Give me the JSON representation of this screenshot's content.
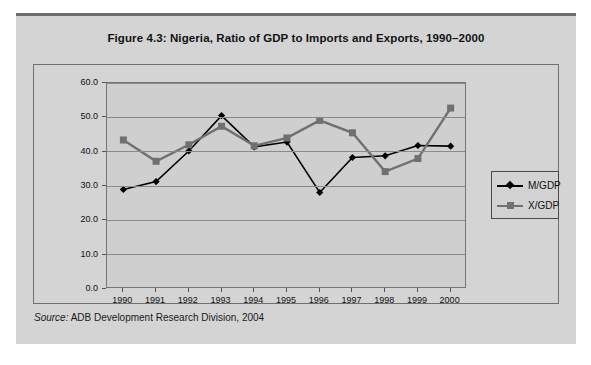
{
  "figure": {
    "title": "Figure 4.3:  Nigeria, Ratio of GDP to Imports and Exports, 1990–2000",
    "source_label": "Source:",
    "source_text": "ADB Development Research Division, 2004"
  },
  "legend": {
    "position": "inside-right",
    "items": [
      {
        "label": "M/GDP",
        "color": "#000000",
        "marker": "diamond"
      },
      {
        "label": "X/GDP",
        "color": "#707070",
        "marker": "square"
      }
    ]
  },
  "axes": {
    "y_tick_labels": [
      "60.0",
      "50.0",
      "40.0",
      "30.0",
      "20.0",
      "10.0",
      "0.0"
    ],
    "x_tick_labels": [
      "1990",
      "1991",
      "1992",
      "1993",
      "1994",
      "1995",
      "1996",
      "1997",
      "1998",
      "1999",
      "2000"
    ]
  },
  "chart_data": {
    "type": "line",
    "title": "Figure 4.3:  Nigeria, Ratio of GDP to Imports and Exports, 1990–2000",
    "xlabel": "",
    "ylabel": "",
    "categories": [
      "1990",
      "1991",
      "1992",
      "1993",
      "1994",
      "1995",
      "1996",
      "1997",
      "1998",
      "1999",
      "2000"
    ],
    "series": [
      {
        "name": "M/GDP",
        "color": "#000000",
        "marker": "diamond",
        "values": [
          29.0,
          31.3,
          40.2,
          50.5,
          41.4,
          42.8,
          28.1,
          38.3,
          38.8,
          41.8,
          41.6
        ]
      },
      {
        "name": "X/GDP",
        "color": "#707070",
        "marker": "square",
        "values": [
          43.4,
          37.2,
          42.0,
          47.4,
          41.7,
          44.0,
          49.1,
          45.5,
          34.2,
          38.0,
          52.7
        ]
      }
    ],
    "ylim": [
      0.0,
      60.0
    ],
    "ytick_step": 10.0,
    "grid": true,
    "legend_position": "inside-right"
  }
}
